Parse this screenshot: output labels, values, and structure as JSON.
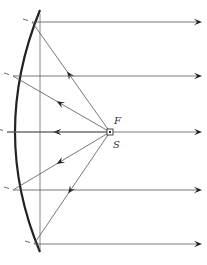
{
  "diagram": {
    "title": "",
    "labels": {
      "focus": "F",
      "source": "S"
    },
    "elements": {
      "mirror": "parabolic-mirror",
      "axis": "vertical-reference-line",
      "source": "point-source-at-focus"
    },
    "rays": [
      {
        "id": "ray-1",
        "direction_to_mirror": "up-left",
        "reflected": "right"
      },
      {
        "id": "ray-2",
        "direction_to_mirror": "up-left",
        "reflected": "right"
      },
      {
        "id": "ray-3",
        "direction_to_mirror": "left",
        "reflected": "right"
      },
      {
        "id": "ray-4",
        "direction_to_mirror": "down-left",
        "reflected": "right"
      },
      {
        "id": "ray-5",
        "direction_to_mirror": "down-left",
        "reflected": "right"
      }
    ],
    "colors": {
      "mirror": "#222222",
      "ray": "#555555",
      "arrow": "#222222"
    }
  }
}
